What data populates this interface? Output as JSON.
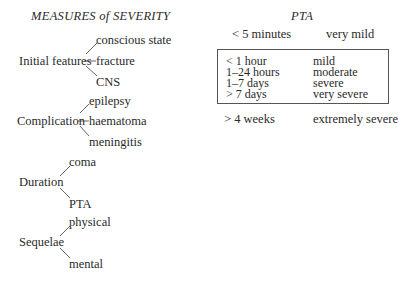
{
  "left": {
    "title": "MEASURES of SEVERITY",
    "groups": [
      {
        "label": "Initial features",
        "children": [
          "conscious state",
          "fracture",
          "CNS"
        ]
      },
      {
        "label": "Complication",
        "children": [
          "epilepsy",
          "haematoma",
          "meningitis"
        ]
      },
      {
        "label": "Duration",
        "children": [
          "coma",
          "PTA"
        ]
      },
      {
        "label": "Sequelae",
        "children": [
          "physical",
          "mental"
        ]
      }
    ]
  },
  "right": {
    "title": "PTA",
    "top_row": {
      "duration": "< 5 minutes",
      "severity": "very mild"
    },
    "boxed_rows": [
      {
        "duration": "< 1 hour",
        "severity": "mild"
      },
      {
        "duration": "1–24 hours",
        "severity": "moderate"
      },
      {
        "duration": "1–7 days",
        "severity": "severe"
      },
      {
        "duration": "> 7 days",
        "severity": "very severe"
      }
    ],
    "bottom_row": {
      "duration": "> 4 weeks",
      "severity": "extremely severe"
    }
  }
}
